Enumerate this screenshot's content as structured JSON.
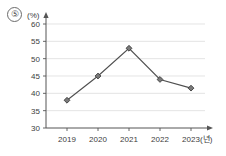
{
  "badge": {
    "label": "⑤"
  },
  "axes": {
    "y_unit": "(%)",
    "x_unit": "(년)"
  },
  "chart_data": {
    "type": "line",
    "title": "",
    "subtitle": "",
    "xlabel": "(년)",
    "ylabel": "(%)",
    "categories": [
      "2019",
      "2020",
      "2021",
      "2022",
      "2023"
    ],
    "values": [
      38,
      45,
      53,
      44,
      41.5
    ],
    "series": [
      {
        "name": "",
        "values": [
          38,
          45,
          53,
          44,
          41.5
        ]
      }
    ],
    "ylim": [
      30,
      60
    ],
    "yticks": [
      30,
      35,
      40,
      45,
      50,
      55,
      60
    ],
    "ytick_labels": [
      "30",
      "35",
      "40",
      "45",
      "50",
      "55",
      "60"
    ],
    "xticks": [
      "2019",
      "2020",
      "2021",
      "2022",
      "2023"
    ],
    "grid": true,
    "grid_axis": "y",
    "legend": false,
    "legend_position": "none",
    "marker": "diamond",
    "line_color": "#4f4f4f",
    "marker_fill": "#7a7a7a",
    "marker_edge": "#3c3c3c",
    "grid_color": "#d9d9d9",
    "axis_color": "#555555",
    "background": "#ffffff",
    "annotations": []
  }
}
